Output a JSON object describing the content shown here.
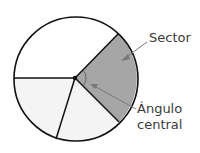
{
  "labels": {
    "sector": "Sector",
    "angle_line1": "Ángulo",
    "angle_line2": "central"
  },
  "colors": {
    "sector_fill": "#a6a6a6",
    "light_fill": "#f4f4f4",
    "white_fill": "#ffffff",
    "stroke": "#111111",
    "arrow": "#777777"
  }
}
